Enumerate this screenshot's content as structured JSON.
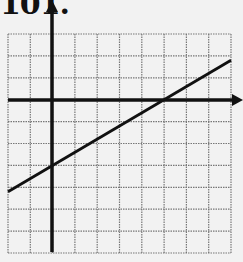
{
  "problem_label": "101.",
  "chart_data": {
    "type": "line",
    "title": "101.",
    "xlabel": "",
    "ylabel": "",
    "grid": true,
    "xlim": [
      -2,
      8
    ],
    "ylim": [
      -7,
      3
    ],
    "tick_labels": false,
    "series": [
      {
        "name": "line",
        "x": [
          -2,
          8
        ],
        "y": [
          -4.2,
          1.8
        ],
        "slope": 0.6,
        "y_intercept": -3,
        "x_intercept": 5
      }
    ],
    "colors": {
      "grid": "#777777",
      "axes": "#111111",
      "line": "#111111",
      "background": "#f2f2f2"
    }
  }
}
